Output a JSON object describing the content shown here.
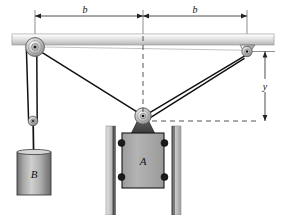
{
  "figure": {
    "type": "mechanics-diagram"
  },
  "labels": {
    "dim_b_left": "b",
    "dim_b_right": "b",
    "dim_y": "y",
    "block_a": "A",
    "block_b": "B"
  },
  "colors": {
    "line": "#1a1a1a",
    "ceiling_light": "#f2f2f2",
    "ceiling_mid": "#d8d8d8",
    "ceiling_dark": "#b0b0b0",
    "block_a_fill": "#a8a8a8",
    "block_a_stroke": "#1a1a1a",
    "bracket_dark": "#4a4a4a",
    "rail_fill": "#cccccc",
    "rail_edge": "#8a8a8a",
    "roller_fill": "#1c1c1c",
    "pulley_light": "#ececec",
    "pulley_mid": "#bdbdbd",
    "pulley_dark": "#7a7a7a",
    "cylinder_light": "#c9c9c9",
    "cylinder_dark": "#6e6e6e",
    "dashed": "#2a2a2a",
    "thin_ref": "#8c8c8c"
  },
  "geometry": {
    "ceiling_y": 36,
    "left_pulley": {
      "cx": 35,
      "cy": 47,
      "r": 9
    },
    "right_anchor": {
      "cx": 247,
      "cy": 51,
      "r": 5
    },
    "center_pulley": {
      "cx": 143,
      "cy": 116,
      "r": 8
    },
    "small_sheave": {
      "cx": 33,
      "cy": 121,
      "r": 4.5
    },
    "block_a": {
      "x": 122,
      "y": 134,
      "w": 42,
      "h": 54
    },
    "cylinder_b": {
      "x": 17,
      "y": 152,
      "w": 34,
      "h": 42
    },
    "dim_b_left_span": [
      35,
      143
    ],
    "dim_b_right_span": [
      143,
      247
    ],
    "dim_y_span": [
      51,
      122
    ],
    "dim_y_x": 265
  },
  "elements": {
    "ceiling": "ceiling-beam",
    "left_bracket": "left-pulley-bracket",
    "right_bracket": "right-anchor-bracket",
    "center_bracket": "center-pulley-bracket",
    "cable": "cable",
    "rails": "vertical-guide-rails",
    "rollers": "block-a-rollers"
  }
}
